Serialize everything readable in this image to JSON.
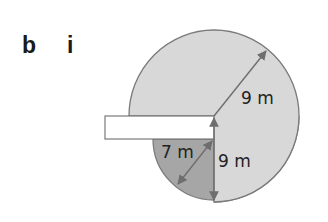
{
  "labels": {
    "part": "b",
    "subpart": "i"
  },
  "diagram": {
    "type": "tethered-area-sector",
    "colors": {
      "large_region": "#d8d8d8",
      "small_region": "#a6a6a6",
      "outline": "#7a7a7a",
      "arrow": "#6e6e6e",
      "barrier": "#ffffff"
    },
    "dimensions": [
      {
        "id": "upper-radius",
        "text": "9 m"
      },
      {
        "id": "lower-radius",
        "text": "9 m"
      },
      {
        "id": "small-radius",
        "text": "7 m"
      }
    ]
  }
}
